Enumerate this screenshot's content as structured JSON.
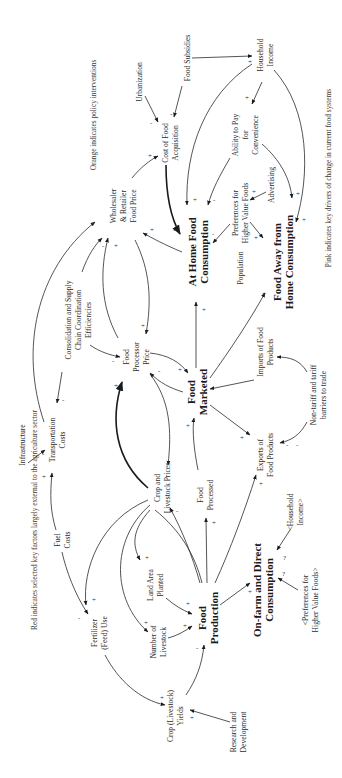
{
  "diagram": {
    "type": "causal-loop-diagram",
    "orientation": "rotated 90 degrees counter-clockwise",
    "notes": {
      "red": "Red indicates selected key factors largely external to the agriculture sector",
      "orange": "Orange indicates policy interventions",
      "pink": "Pink indicates key drivers of change in current food systems"
    },
    "nodes": {
      "urbanization": [
        "Urbanization"
      ],
      "food_subsidies": [
        "Food Subsidies"
      ],
      "household_income": [
        "Household",
        "Income"
      ],
      "cost_food_acq": [
        "Cost of Food",
        "Acquisition"
      ],
      "ability_pay": [
        "Ability to Pay",
        "for",
        "Convenience"
      ],
      "advertising": [
        "Advertising"
      ],
      "pref_hvf": [
        "Preferences for",
        "Higher Value Foods"
      ],
      "wholesaler": [
        "Wholesaler",
        "& Retailer",
        "Food Price"
      ],
      "at_home": [
        "At Home Food",
        "Consumption"
      ],
      "away_home": [
        "Food Away from",
        "Home Consumption"
      ],
      "population": [
        "Population"
      ],
      "consolidation": [
        "Consolidation and Supply",
        "Chain Coordination",
        "Efficiencies"
      ],
      "food_processor_price": [
        "Food",
        "Processor",
        "Price"
      ],
      "food_marketed": [
        "Food",
        "Marketed"
      ],
      "imports": [
        "Imports of Food",
        "Products"
      ],
      "nontariff": [
        "Non-tariff and tariff",
        "barriers to trade"
      ],
      "exports": [
        "Exports of",
        "Food Products"
      ],
      "infrastructure": [
        "Infrastructure"
      ],
      "transportation": [
        "Transportation",
        "Costs"
      ],
      "fuel": [
        "Fuel",
        "Costs"
      ],
      "crop_prices": [
        "Crop and",
        "Livestock Prices"
      ],
      "food_processed": [
        "Food",
        "Processed"
      ],
      "hh_income_shadow": [
        "<Household",
        "Income>"
      ],
      "land_area": [
        "Land Area",
        "Planted"
      ],
      "fertilizer": [
        "Fertilizer",
        "(Feed) Use"
      ],
      "livestock": [
        "Number of",
        "Livestock"
      ],
      "food_production": [
        "Food",
        "Production"
      ],
      "on_farm": [
        "On-farm and Direct",
        "Consumption"
      ],
      "pref_hvf_shadow": [
        "<Preferences for",
        "Higher Value Foods>"
      ],
      "yields": [
        "Crop (Livestock)",
        "Yields"
      ],
      "rnd": [
        "Research and",
        "Development"
      ]
    },
    "signs": {
      "plus": "+",
      "minus": "-",
      "unknown": "?"
    }
  }
}
